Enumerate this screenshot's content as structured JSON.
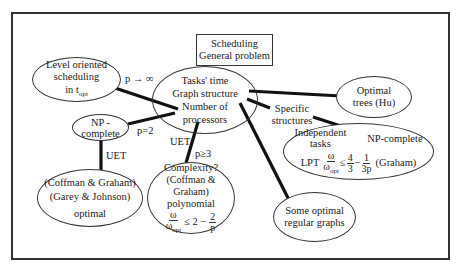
{
  "diagram": {
    "root": {
      "line1": "Scheduling",
      "line2": "General problem"
    },
    "center": {
      "line1": "Tasks' time",
      "line2": "Graph structure",
      "line3": "Number of",
      "line4": "processors"
    },
    "level_oriented": {
      "line1": "Level oriented",
      "line2": "scheduling",
      "line3_pre": "in t",
      "line3_sub": "opt"
    },
    "np_complete": {
      "line1": "NP -",
      "line2": "complete"
    },
    "coffman_optimal": {
      "line1": "(Coffman & Graham)",
      "line2": "(Garey & Johnson)",
      "line3": "optimal"
    },
    "complexity": {
      "line1": "Complexity?",
      "line2": "(Coffman & Graham)",
      "line3": "polynomial",
      "frac_num": "ω",
      "frac_den_pre": "ω",
      "frac_den_sub": "opt",
      "ineq": "≤ 2 −",
      "frac2_num": "2",
      "frac2_den": "p"
    },
    "optimal_trees": {
      "line1": "Optimal",
      "line2": "trees (Hu)"
    },
    "specific": {
      "line1": "Specific",
      "line2": "structures"
    },
    "independent": {
      "line1": "Independent",
      "line2": "tasks",
      "np": "NP-complete",
      "lpt": "LPT",
      "frac_num": "ω",
      "frac_den_pre": "ω",
      "frac_den_sub": "opt",
      "leq": "≤",
      "frac2_num": "4",
      "frac2_den": "3",
      "minus": "−",
      "frac3_num": "1",
      "frac3_den": "3p",
      "cite": "(Graham)"
    },
    "regular_graphs": {
      "line1": "Some optimal",
      "line2": "regular graphs"
    },
    "edge_labels": {
      "p_inf": "p → ∞",
      "p2": "p=2",
      "uet1": "UET",
      "uet2": "UET",
      "p3": "p≥3"
    },
    "colors": {
      "line": "#111111",
      "border": "#333333",
      "text": "#1a1a1a"
    }
  }
}
